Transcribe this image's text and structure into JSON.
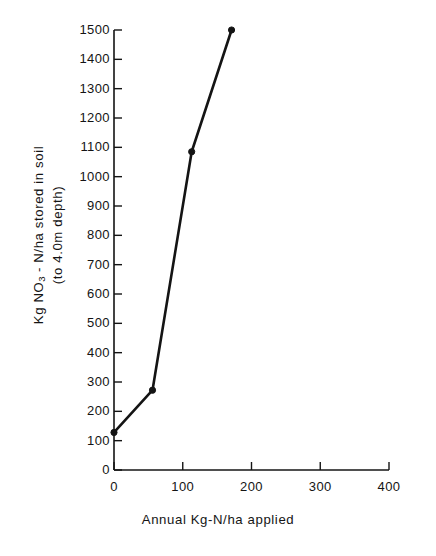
{
  "chart_data": {
    "type": "line",
    "title": "",
    "xlabel": "Annual  Kg-N/ha  applied",
    "ylabel_line1": "Kg  NO3 - N/ha  stored  in  soil",
    "ylabel_line2": "(to  4.0m  depth)",
    "ylabel_prefix": "Kg  NO",
    "ylabel_sub": "3",
    "ylabel_suffix": " - N/ha  stored  in  soil",
    "x": [
      0,
      56,
      113,
      171
    ],
    "values": [
      128,
      272,
      1085,
      1500
    ],
    "series": [
      {
        "name": "NO3-N stored in soil",
        "points": [
          {
            "x": 0,
            "y": 128
          },
          {
            "x": 56,
            "y": 272
          },
          {
            "x": 113,
            "y": 1085
          },
          {
            "x": 171,
            "y": 1500
          }
        ]
      }
    ],
    "xlim": [
      0,
      400
    ],
    "ylim": [
      0,
      1500
    ],
    "xticks": [
      0,
      100,
      200,
      300,
      400
    ],
    "xtick_labels": [
      "0",
      "100",
      "200",
      "300",
      "400"
    ],
    "yticks": [
      0,
      100,
      200,
      300,
      400,
      500,
      600,
      700,
      800,
      900,
      1000,
      1100,
      1200,
      1300,
      1400,
      1500
    ],
    "ytick_labels": [
      "0",
      "100",
      "200",
      "300",
      "400",
      "500",
      "600",
      "700",
      "800",
      "900",
      "1000",
      "1100",
      "1200",
      "1300",
      "1400",
      "1500"
    ],
    "grid": false,
    "legend": null,
    "marker": "filled-circle",
    "line_color": "#141414",
    "background_color": "#ffffff",
    "tick_direction": "inward"
  }
}
